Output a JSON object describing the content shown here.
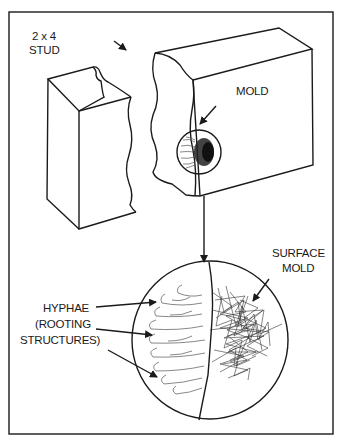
{
  "diagram": {
    "labels": {
      "stud_line1": "2 x 4",
      "stud_line2": "STUD",
      "mold": "MOLD",
      "surface_line1": "SURFACE",
      "surface_line2": "MOLD",
      "hyphae_line1": "HYPHAE",
      "hyphae_line2": "(ROOTING",
      "hyphae_line3": "STRUCTURES)"
    },
    "colors": {
      "ink": "#1a1a1a",
      "background": "#ffffff"
    }
  }
}
